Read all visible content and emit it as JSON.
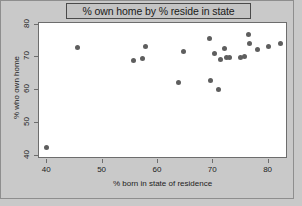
{
  "chart_data": {
    "type": "scatter",
    "title": "% own home by % reside in state",
    "xlabel": "% born in state of residence",
    "ylabel": "% who own home",
    "xlim": [
      38.5,
      83.5
    ],
    "ylim": [
      39.0,
      80.5
    ],
    "xticks": [
      40,
      50,
      60,
      70,
      80
    ],
    "yticks": [
      40,
      50,
      60,
      70,
      80
    ],
    "grid": false,
    "legend": null,
    "marker": {
      "shape": "circle",
      "color": "#5e5e5e",
      "size_px": 5
    },
    "points": [
      {
        "x": 39.8,
        "y": 42.5
      },
      {
        "x": 45.4,
        "y": 72.9
      },
      {
        "x": 55.6,
        "y": 69.2
      },
      {
        "x": 57.2,
        "y": 69.6
      },
      {
        "x": 57.8,
        "y": 73.3
      },
      {
        "x": 63.8,
        "y": 62.2
      },
      {
        "x": 64.6,
        "y": 71.7
      },
      {
        "x": 69.3,
        "y": 75.9
      },
      {
        "x": 69.5,
        "y": 62.9
      },
      {
        "x": 70.3,
        "y": 71.2
      },
      {
        "x": 70.9,
        "y": 60.1
      },
      {
        "x": 71.3,
        "y": 69.4
      },
      {
        "x": 72.1,
        "y": 72.6
      },
      {
        "x": 72.3,
        "y": 69.9
      },
      {
        "x": 72.9,
        "y": 69.9
      },
      {
        "x": 75.0,
        "y": 70.1
      },
      {
        "x": 75.7,
        "y": 70.2
      },
      {
        "x": 76.3,
        "y": 77.1
      },
      {
        "x": 76.5,
        "y": 74.3
      },
      {
        "x": 77.9,
        "y": 72.3
      },
      {
        "x": 79.9,
        "y": 73.2
      },
      {
        "x": 82.2,
        "y": 74.1
      }
    ]
  },
  "colors": {
    "figure_background": "#c9c9c9",
    "plot_background": "#ffffff",
    "marker": "#5e5e5e",
    "axis": "#6d6d6d",
    "title_box_background": "#c4c4c4",
    "title_box_border": "#4a4a4a",
    "text": "#1a1a1a"
  }
}
